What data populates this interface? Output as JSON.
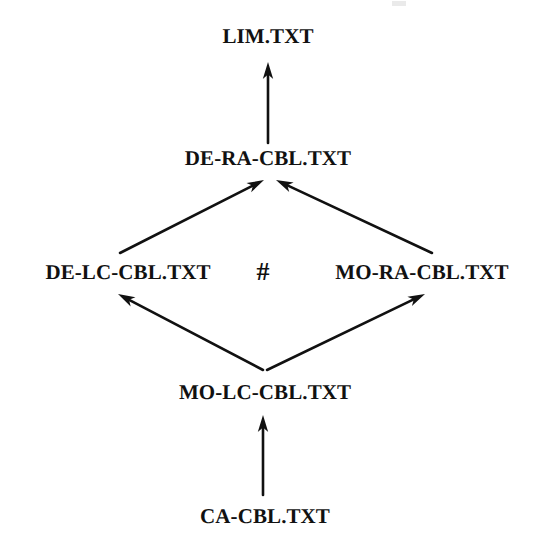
{
  "diagram": {
    "title_text": "",
    "background_color": "#ffffff",
    "ink_color": "#111111",
    "separator_symbol": "#",
    "nodes": [
      {
        "id": "lim",
        "label": "LIM.TXT",
        "x": 268,
        "y": 36
      },
      {
        "id": "de-ra-cbl",
        "label": "DE-RA-CBL.TXT",
        "x": 268,
        "y": 158
      },
      {
        "id": "de-lc-cbl",
        "label": "DE-LC-CBL.TXT",
        "x": 128,
        "y": 272
      },
      {
        "id": "mo-ra-cbl",
        "label": "MO-RA-CBL.TXT",
        "x": 422,
        "y": 272
      },
      {
        "id": "mo-lc-cbl",
        "label": "MO-LC-CBL.TXT",
        "x": 265,
        "y": 392
      },
      {
        "id": "ca-cbl",
        "label": "CA-CBL.TXT",
        "x": 265,
        "y": 516
      }
    ],
    "hash": {
      "label": "#",
      "x": 263,
      "y": 272
    },
    "edges": [
      {
        "id": "edge-de-ra-to-lim",
        "from": "de-ra-cbl",
        "to": "lim",
        "x1": 268,
        "y1": 143,
        "x2": 268,
        "y2": 62,
        "direction": "up"
      },
      {
        "id": "edge-de-lc-to-de-ra",
        "from": "de-lc-cbl",
        "to": "de-ra-cbl",
        "x1": 120,
        "y1": 253,
        "x2": 264,
        "y2": 180,
        "direction": "up-right"
      },
      {
        "id": "edge-mo-ra-to-de-ra",
        "from": "mo-ra-cbl",
        "to": "de-ra-cbl",
        "x1": 432,
        "y1": 253,
        "x2": 276,
        "y2": 180,
        "direction": "up-left"
      },
      {
        "id": "edge-mo-lc-to-de-lc",
        "from": "mo-lc-cbl",
        "to": "de-lc-cbl",
        "x1": 263,
        "y1": 370,
        "x2": 118,
        "y2": 294,
        "direction": "up-left"
      },
      {
        "id": "edge-mo-lc-to-mo-ra",
        "from": "mo-lc-cbl",
        "to": "mo-ra-cbl",
        "x1": 267,
        "y1": 370,
        "x2": 425,
        "y2": 294,
        "direction": "up-right"
      },
      {
        "id": "edge-ca-cbl-to-mo-lc",
        "from": "ca-cbl",
        "to": "mo-lc-cbl",
        "x1": 263,
        "y1": 495,
        "x2": 263,
        "y2": 415,
        "direction": "up"
      }
    ]
  }
}
